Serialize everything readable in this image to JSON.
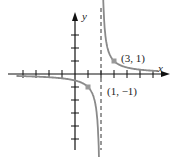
{
  "chart_data": {
    "type": "line",
    "title": "",
    "function": "y = 1/(x - 2)",
    "xlabel": "x",
    "ylabel": "y",
    "xlim": [
      -4,
      6.5
    ],
    "ylim": [
      -5,
      4.5
    ],
    "vertical_asymptote": 2,
    "horizontal_asymptote": 0,
    "x_ticks": [
      -4,
      -3,
      -2,
      -1,
      1,
      2,
      3,
      4,
      5,
      6
    ],
    "y_ticks": [
      -5,
      -4,
      -3,
      -2,
      -1,
      1,
      2,
      3
    ],
    "grid": false,
    "labeled_points": [
      {
        "x": 3,
        "y": 1,
        "label": "(3, 1)"
      },
      {
        "x": 1,
        "y": -1,
        "label": "(1, −1)"
      }
    ],
    "colors": {
      "curve": "#8a8a8a",
      "axes": "#111111",
      "point": "#999999"
    }
  }
}
